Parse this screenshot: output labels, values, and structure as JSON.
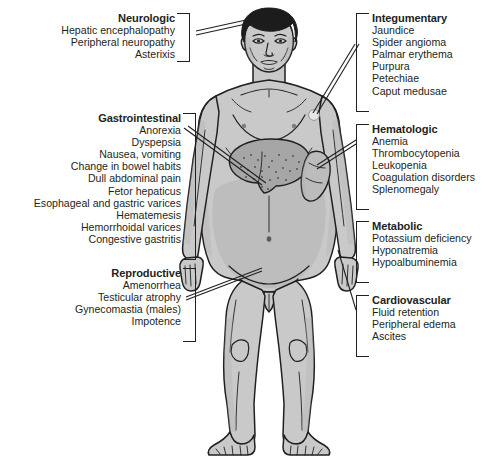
{
  "diagram": {
    "figure": {
      "name": "human-male-figure",
      "organs": [
        "liver",
        "spleen"
      ],
      "colors": {
        "background": "#ffffff",
        "skin": "#c9c9c9",
        "skin_shadow": "#b3b3b3",
        "hair": "#1c1c1c",
        "liver": "#a8a8a8",
        "spleen": "#bdbdbd",
        "outline": "#231f20",
        "text": "#231f20"
      }
    },
    "blocks": [
      {
        "id": "neurologic",
        "side": "left",
        "title": "Neurologic",
        "items": [
          "Hepatic encephalopathy",
          "Peripheral neuropathy",
          "Asterixis"
        ]
      },
      {
        "id": "gastrointestinal",
        "side": "left",
        "title": "Gastrointestinal",
        "items": [
          "Anorexia",
          "Dyspepsia",
          "Nausea, vomiting",
          "Change in bowel habits",
          "Dull abdominal pain",
          "Fetor hepaticus",
          "Esophageal and gastric varices",
          "Hematemesis",
          "Hemorrhoidal varices",
          "Congestive gastritis"
        ]
      },
      {
        "id": "reproductive",
        "side": "left",
        "title": "Reproductive",
        "items": [
          "Amenorrhea",
          "Testicular atrophy",
          "Gynecomastia (males)",
          "Impotence"
        ]
      },
      {
        "id": "integumentary",
        "side": "right",
        "title": "Integumentary",
        "items": [
          "Jaundice",
          "Spider angioma",
          "Palmar erythema",
          "Purpura",
          "Petechiae",
          "Caput medusae"
        ]
      },
      {
        "id": "hematologic",
        "side": "right",
        "title": "Hematologic",
        "items": [
          "Anemia",
          "Thrombocytopenia",
          "Leukopenia",
          "Coagulation disorders",
          "Splenomegaly"
        ]
      },
      {
        "id": "metabolic",
        "side": "right",
        "title": "Metabolic",
        "items": [
          "Potassium deficiency",
          "Hyponatremia",
          "Hypoalbuminemia"
        ]
      },
      {
        "id": "cardiovascular",
        "side": "right",
        "title": "Cardiovascular",
        "items": [
          "Fluid retention",
          "Peripheral edema",
          "Ascites"
        ]
      }
    ]
  }
}
